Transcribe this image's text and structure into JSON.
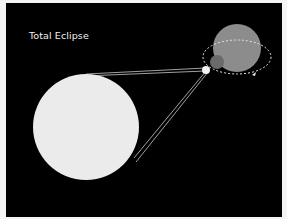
{
  "title": "Total Eclipse",
  "bodies": {
    "sun": {
      "label": "sun",
      "color": "#ebebeb"
    },
    "earth": {
      "label": "earth",
      "color": "#8a8a8a"
    },
    "moon": {
      "label": "moon",
      "color": "#6a6a6a"
    },
    "orbit_color": "#e8e8e8",
    "ray_color": "#cccccc"
  }
}
